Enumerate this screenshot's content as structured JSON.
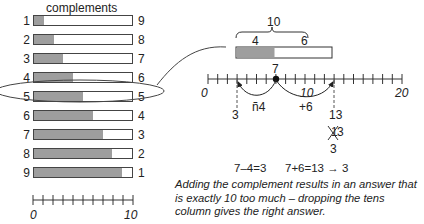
{
  "left_panel": {
    "title": "complements",
    "rows": [
      {
        "left": "1",
        "right": "9",
        "fill": 1
      },
      {
        "left": "2",
        "right": "8",
        "fill": 2
      },
      {
        "left": "3",
        "right": "7",
        "fill": 3
      },
      {
        "left": "4",
        "right": "6",
        "fill": 4,
        "highlighted": true
      },
      {
        "left": "5",
        "right": "5",
        "fill": 5
      },
      {
        "left": "6",
        "right": "4",
        "fill": 6
      },
      {
        "left": "7",
        "right": "3",
        "fill": 7
      },
      {
        "left": "8",
        "right": "2",
        "fill": 8
      },
      {
        "left": "9",
        "right": "1",
        "fill": 9
      }
    ],
    "scale": {
      "start_label": "0",
      "end_label": "10",
      "ticks": 11
    }
  },
  "right_panel": {
    "brace_label": "10",
    "bar_left_label": "4",
    "bar_right_label": "6",
    "start_point_label": "7",
    "number_line": {
      "start_label": "0",
      "mid_label": "10",
      "end_label": "20"
    },
    "jump_back_label": "ñ4",
    "jump_forward_label": "+6",
    "result_back": "3",
    "result_forward": "13",
    "crossed_out_digit": "1",
    "crossed_kept_digit": "3",
    "final_result": "3",
    "equation_subtract": "7–4=3",
    "equation_add": "7+6=13 → 3",
    "caption": "Adding the complement results in an answer that is exactly 10 too much – dropping the tens column gives the right answer."
  },
  "colors": {
    "fill_gray": "#9e9e9e",
    "line": "#333333",
    "text": "#222222"
  }
}
